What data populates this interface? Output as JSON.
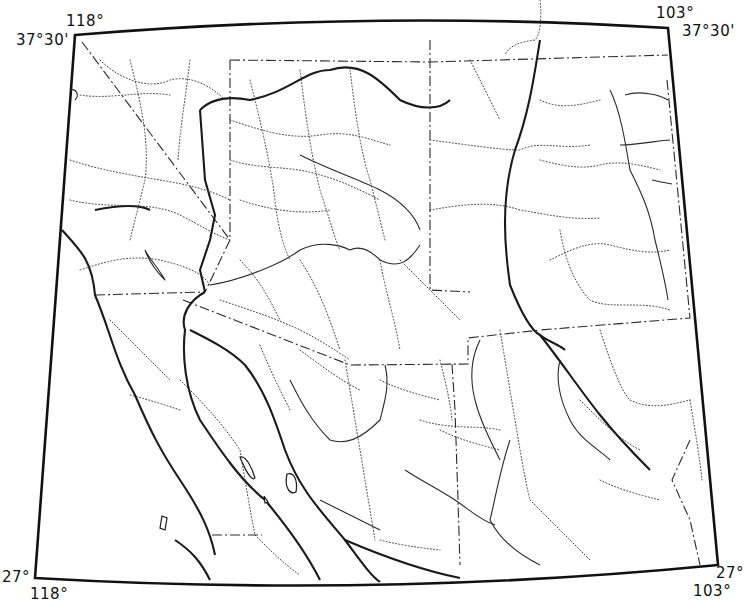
{
  "map": {
    "title": "",
    "style": "black-and-white outline base map",
    "region": "Southwestern United States and Northern Mexico",
    "corner_labels": {
      "top_left_lon": "118°",
      "top_left_lat": "37°30'",
      "top_right_lon": "103°",
      "top_right_lat": "37°30'",
      "bottom_left_lat": "27°",
      "bottom_left_lon": "118°",
      "bottom_right_lat": "27°",
      "bottom_right_lon": "103°"
    },
    "line_styles": {
      "frame": "solid heavy",
      "coastline": "solid heavy",
      "rivers": "solid thin",
      "roads": "dotted",
      "boundaries": "dash-dot"
    },
    "colors": {
      "ink": "#111111",
      "background": "#ffffff"
    }
  }
}
